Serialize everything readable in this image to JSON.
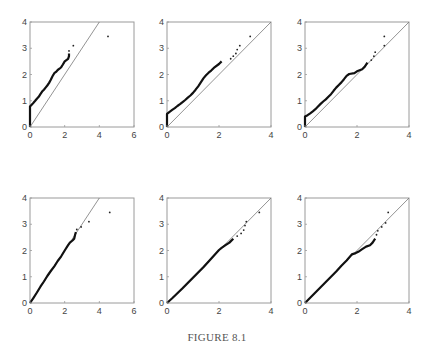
{
  "caption": "FIGURE 8.1",
  "chart_data": [
    {
      "type": "scatter",
      "panel": "row1-col1",
      "title": "",
      "xlabel": "",
      "ylabel": "",
      "xlim": [
        0,
        6
      ],
      "ylim": [
        0,
        4
      ],
      "xticks": [
        "0",
        "2",
        "4",
        "6"
      ],
      "yticks": [
        "0",
        "1",
        "2",
        "3",
        "4"
      ],
      "reference_line": "y = x",
      "grid": false,
      "points": [
        [
          0,
          0
        ],
        [
          0,
          0.3
        ],
        [
          0,
          0.6
        ],
        [
          0,
          0.78
        ],
        [
          0.1,
          0.85
        ],
        [
          0.2,
          0.92
        ],
        [
          0.3,
          1.0
        ],
        [
          0.4,
          1.08
        ],
        [
          0.5,
          1.15
        ],
        [
          0.6,
          1.25
        ],
        [
          0.7,
          1.35
        ],
        [
          0.8,
          1.42
        ],
        [
          0.9,
          1.5
        ],
        [
          1.0,
          1.58
        ],
        [
          1.1,
          1.68
        ],
        [
          1.2,
          1.8
        ],
        [
          1.3,
          1.93
        ],
        [
          1.4,
          2.05
        ],
        [
          1.5,
          2.1
        ],
        [
          1.6,
          2.17
        ],
        [
          1.7,
          2.22
        ],
        [
          1.8,
          2.28
        ],
        [
          1.9,
          2.38
        ],
        [
          2.0,
          2.5
        ],
        [
          2.2,
          2.6
        ],
        [
          2.25,
          2.7
        ],
        [
          2.25,
          2.8
        ],
        [
          2.25,
          2.9
        ],
        [
          2.5,
          3.1
        ],
        [
          4.5,
          3.45
        ]
      ]
    },
    {
      "type": "scatter",
      "panel": "row1-col2",
      "title": "",
      "xlabel": "",
      "ylabel": "",
      "xlim": [
        0,
        4
      ],
      "ylim": [
        0,
        4
      ],
      "xticks": [
        "0",
        "2",
        "4"
      ],
      "yticks": [
        "0",
        "1",
        "2",
        "3",
        "4"
      ],
      "reference_line": "y = x",
      "grid": false,
      "points": [
        [
          0,
          0
        ],
        [
          0,
          0.25
        ],
        [
          0,
          0.5
        ],
        [
          0.1,
          0.58
        ],
        [
          0.2,
          0.65
        ],
        [
          0.3,
          0.72
        ],
        [
          0.4,
          0.8
        ],
        [
          0.5,
          0.87
        ],
        [
          0.6,
          0.95
        ],
        [
          0.7,
          1.03
        ],
        [
          0.8,
          1.12
        ],
        [
          0.9,
          1.2
        ],
        [
          1.0,
          1.3
        ],
        [
          1.1,
          1.42
        ],
        [
          1.2,
          1.55
        ],
        [
          1.3,
          1.7
        ],
        [
          1.4,
          1.85
        ],
        [
          1.5,
          1.97
        ],
        [
          1.6,
          2.07
        ],
        [
          1.7,
          2.15
        ],
        [
          1.8,
          2.25
        ],
        [
          2.0,
          2.4
        ],
        [
          2.1,
          2.5
        ],
        [
          2.45,
          2.6
        ],
        [
          2.55,
          2.7
        ],
        [
          2.65,
          2.8
        ],
        [
          2.7,
          2.95
        ],
        [
          2.8,
          3.1
        ],
        [
          3.2,
          3.45
        ]
      ]
    },
    {
      "type": "scatter",
      "panel": "row1-col3",
      "title": "",
      "xlabel": "",
      "ylabel": "",
      "xlim": [
        0,
        4
      ],
      "ylim": [
        0,
        4
      ],
      "xticks": [
        "0",
        "2",
        "4"
      ],
      "yticks": [
        "0",
        "1",
        "2",
        "3",
        "4"
      ],
      "reference_line": "y = x",
      "grid": false,
      "points": [
        [
          0,
          0
        ],
        [
          0,
          0.2
        ],
        [
          0,
          0.4
        ],
        [
          0.1,
          0.45
        ],
        [
          0.2,
          0.52
        ],
        [
          0.3,
          0.6
        ],
        [
          0.4,
          0.68
        ],
        [
          0.5,
          0.78
        ],
        [
          0.6,
          0.88
        ],
        [
          0.7,
          0.97
        ],
        [
          0.8,
          1.05
        ],
        [
          0.9,
          1.15
        ],
        [
          1.0,
          1.25
        ],
        [
          1.1,
          1.38
        ],
        [
          1.2,
          1.5
        ],
        [
          1.3,
          1.6
        ],
        [
          1.4,
          1.7
        ],
        [
          1.5,
          1.82
        ],
        [
          1.6,
          1.95
        ],
        [
          1.7,
          2.02
        ],
        [
          1.9,
          2.05
        ],
        [
          2.0,
          2.12
        ],
        [
          2.2,
          2.2
        ],
        [
          2.3,
          2.3
        ],
        [
          2.4,
          2.45
        ],
        [
          2.55,
          2.55
        ],
        [
          2.65,
          2.7
        ],
        [
          2.7,
          2.85
        ],
        [
          3.05,
          3.1
        ],
        [
          3.05,
          3.45
        ]
      ]
    },
    {
      "type": "scatter",
      "panel": "row2-col1",
      "title": "",
      "xlabel": "",
      "ylabel": "",
      "xlim": [
        0,
        6
      ],
      "ylim": [
        0,
        4
      ],
      "xticks": [
        "0",
        "2",
        "4",
        "6"
      ],
      "yticks": [
        "0",
        "1",
        "2",
        "3",
        "4"
      ],
      "reference_line": "y = x",
      "grid": false,
      "points": [
        [
          0,
          0
        ],
        [
          0.2,
          0.2
        ],
        [
          0.4,
          0.4
        ],
        [
          0.6,
          0.62
        ],
        [
          0.8,
          0.82
        ],
        [
          1.0,
          1.03
        ],
        [
          1.2,
          1.22
        ],
        [
          1.4,
          1.4
        ],
        [
          1.6,
          1.6
        ],
        [
          1.8,
          1.78
        ],
        [
          2.0,
          2.0
        ],
        [
          2.2,
          2.2
        ],
        [
          2.3,
          2.3
        ],
        [
          2.45,
          2.38
        ],
        [
          2.55,
          2.45
        ],
        [
          2.6,
          2.6
        ],
        [
          2.65,
          2.7
        ],
        [
          2.7,
          2.8
        ],
        [
          2.95,
          2.9
        ],
        [
          3.4,
          3.1
        ],
        [
          4.6,
          3.45
        ]
      ]
    },
    {
      "type": "scatter",
      "panel": "row2-col2",
      "title": "",
      "xlabel": "",
      "ylabel": "",
      "xlim": [
        0,
        4
      ],
      "ylim": [
        0,
        4
      ],
      "xticks": [
        "0",
        "2",
        "4"
      ],
      "yticks": [
        "0",
        "1",
        "2",
        "3",
        "4"
      ],
      "reference_line": "y = x",
      "grid": false,
      "points": [
        [
          0,
          0
        ],
        [
          0.2,
          0.18
        ],
        [
          0.4,
          0.37
        ],
        [
          0.6,
          0.56
        ],
        [
          0.8,
          0.76
        ],
        [
          1.0,
          0.96
        ],
        [
          1.2,
          1.16
        ],
        [
          1.4,
          1.36
        ],
        [
          1.6,
          1.58
        ],
        [
          1.8,
          1.8
        ],
        [
          2.0,
          2.02
        ],
        [
          2.1,
          2.1
        ],
        [
          2.25,
          2.2
        ],
        [
          2.4,
          2.3
        ],
        [
          2.55,
          2.45
        ],
        [
          2.7,
          2.55
        ],
        [
          2.85,
          2.65
        ],
        [
          2.95,
          2.78
        ],
        [
          3.0,
          2.95
        ],
        [
          3.05,
          3.1
        ],
        [
          3.55,
          3.45
        ]
      ]
    },
    {
      "type": "scatter",
      "panel": "row2-col3",
      "title": "",
      "xlabel": "",
      "ylabel": "",
      "xlim": [
        0,
        4
      ],
      "ylim": [
        0,
        4
      ],
      "xticks": [
        "0",
        "2",
        "4"
      ],
      "yticks": [
        "0",
        "1",
        "2",
        "3",
        "4"
      ],
      "reference_line": "y = x",
      "grid": false,
      "points": [
        [
          0,
          0
        ],
        [
          0.2,
          0.2
        ],
        [
          0.4,
          0.4
        ],
        [
          0.6,
          0.6
        ],
        [
          0.8,
          0.8
        ],
        [
          1.0,
          1.0
        ],
        [
          1.2,
          1.2
        ],
        [
          1.4,
          1.42
        ],
        [
          1.6,
          1.62
        ],
        [
          1.8,
          1.85
        ],
        [
          1.95,
          1.9
        ],
        [
          2.05,
          1.95
        ],
        [
          2.2,
          2.05
        ],
        [
          2.35,
          2.15
        ],
        [
          2.5,
          2.2
        ],
        [
          2.6,
          2.3
        ],
        [
          2.7,
          2.45
        ],
        [
          2.75,
          2.6
        ],
        [
          2.8,
          2.75
        ],
        [
          2.95,
          2.9
        ],
        [
          3.1,
          3.05
        ],
        [
          3.2,
          3.45
        ]
      ]
    }
  ]
}
